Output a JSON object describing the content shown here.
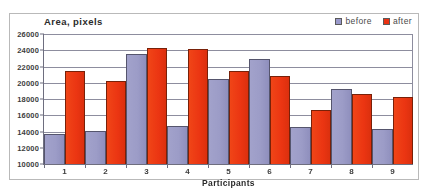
{
  "chart_data": {
    "type": "bar",
    "title": "Area, pixels",
    "xlabel": "Participants",
    "ylabel": "",
    "categories": [
      "1",
      "2",
      "3",
      "4",
      "5",
      "6",
      "7",
      "8",
      "9"
    ],
    "series": [
      {
        "name": "before",
        "color": "#9999cc",
        "values": [
          13700,
          14100,
          23600,
          14700,
          20500,
          22900,
          14500,
          19200,
          14300
        ]
      },
      {
        "name": "after",
        "color": "#f03010",
        "values": [
          21400,
          20200,
          24300,
          24100,
          21500,
          20800,
          16700,
          18600,
          18200
        ]
      }
    ],
    "ylim": [
      10000,
      26000
    ],
    "ytick_step": 2000,
    "yticks": [
      "26000",
      "24000",
      "22000",
      "20000",
      "18000",
      "16000",
      "14000",
      "12000",
      "10000"
    ],
    "grid": true,
    "legend_position": "top-right"
  },
  "legend": {
    "items": [
      {
        "label": "before",
        "swatch": "legend-swatch-before"
      },
      {
        "label": "after",
        "swatch": "legend-swatch-after"
      }
    ]
  }
}
